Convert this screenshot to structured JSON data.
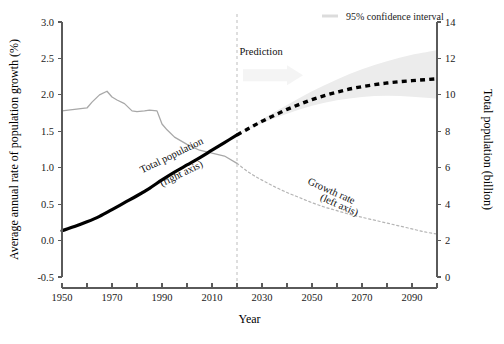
{
  "chart_data": {
    "type": "line",
    "title": "",
    "xlabel": "Year",
    "ylabel_left": "Average annual rate of population growth (%)",
    "ylabel_right": "Total population (billion)",
    "xlim": [
      1950,
      2100
    ],
    "ylim_left": [
      -0.5,
      3.0
    ],
    "ylim_right": [
      0,
      14
    ],
    "x_ticks_labeled": [
      1950,
      1970,
      1990,
      2010,
      2030,
      2050,
      2070,
      2090
    ],
    "x_ticks_minor": [
      1960,
      1980,
      2000,
      2020,
      2040,
      2060,
      2080,
      2100
    ],
    "y_ticks_left": [
      "3.0",
      "2.5",
      "2.0",
      "1.5",
      "1.0",
      "0.5",
      "0.0",
      "-0.5"
    ],
    "y_ticks_right": [
      "14",
      "12",
      "10",
      "8",
      "6",
      "4",
      "2",
      "0"
    ],
    "grid": false,
    "prediction_start_year": 2020,
    "annotations": [
      {
        "name": "prediction-label",
        "text": "Prediction",
        "x": 2021,
        "y_left": 2.55
      },
      {
        "name": "total-population-label-line1",
        "text": "Total population",
        "x": 1982,
        "y_left": 0.92
      },
      {
        "name": "total-population-label-line2",
        "text": "(right axis)",
        "x": 1990,
        "y_left": 0.74
      },
      {
        "name": "growth-rate-label-line1",
        "text": "Growth rate",
        "x": 2048,
        "y_left": 0.78
      },
      {
        "name": "growth-rate-label-line2",
        "text": "(left axis)",
        "x": 2053,
        "y_left": 0.56
      }
    ],
    "legend": {
      "position": "top-right",
      "entries": [
        {
          "label": "95% confidence interval",
          "color": "#dcdcdc",
          "marker": "line"
        }
      ]
    },
    "series": [
      {
        "name": "Growth rate (historical)",
        "axis": "left",
        "style": "solid",
        "color": "#a8a8a8",
        "x": [
          1950,
          1955,
          1960,
          1962,
          1965,
          1968,
          1970,
          1972,
          1975,
          1978,
          1980,
          1983,
          1985,
          1988,
          1990,
          1992,
          1995,
          2000,
          2005,
          2010,
          2015,
          2020
        ],
        "y": [
          1.78,
          1.8,
          1.82,
          1.9,
          2.0,
          2.05,
          1.97,
          1.93,
          1.88,
          1.78,
          1.77,
          1.78,
          1.79,
          1.78,
          1.6,
          1.52,
          1.42,
          1.32,
          1.24,
          1.2,
          1.16,
          1.06
        ]
      },
      {
        "name": "Growth rate (projection)",
        "axis": "left",
        "style": "dotted",
        "color": "#b5b5b5",
        "x": [
          2020,
          2025,
          2030,
          2035,
          2040,
          2045,
          2050,
          2055,
          2060,
          2065,
          2070,
          2075,
          2080,
          2085,
          2090,
          2095,
          2100
        ],
        "y": [
          1.06,
          0.93,
          0.83,
          0.74,
          0.66,
          0.59,
          0.52,
          0.46,
          0.41,
          0.36,
          0.32,
          0.28,
          0.24,
          0.2,
          0.16,
          0.12,
          0.09
        ]
      },
      {
        "name": "Total population (historical)",
        "axis": "right",
        "style": "solid-bold",
        "color": "#000000",
        "x": [
          1950,
          1955,
          1960,
          1965,
          1970,
          1975,
          1980,
          1985,
          1990,
          1995,
          2000,
          2005,
          2010,
          2015,
          2020
        ],
        "y": [
          2.54,
          2.77,
          3.03,
          3.33,
          3.7,
          4.08,
          4.46,
          4.87,
          5.33,
          5.76,
          6.15,
          6.54,
          6.96,
          7.38,
          7.8
        ]
      },
      {
        "name": "Total population (projection)",
        "axis": "right",
        "style": "dashed-bold",
        "color": "#000000",
        "x": [
          2020,
          2025,
          2030,
          2035,
          2040,
          2045,
          2050,
          2055,
          2060,
          2065,
          2070,
          2075,
          2080,
          2085,
          2090,
          2095,
          2100
        ],
        "y": [
          7.8,
          8.18,
          8.55,
          8.88,
          9.2,
          9.48,
          9.74,
          9.96,
          10.15,
          10.32,
          10.45,
          10.56,
          10.65,
          10.72,
          10.78,
          10.83,
          10.88
        ]
      },
      {
        "name": "95% confidence interval upper",
        "axis": "right",
        "style": "band",
        "color": "#ececec",
        "x": [
          2020,
          2030,
          2040,
          2050,
          2060,
          2070,
          2080,
          2090,
          2100
        ],
        "y": [
          7.82,
          8.66,
          9.45,
          10.2,
          10.85,
          11.4,
          11.85,
          12.2,
          12.45
        ]
      },
      {
        "name": "95% confidence interval lower",
        "axis": "right",
        "style": "band",
        "color": "#ececec",
        "x": [
          2020,
          2030,
          2040,
          2050,
          2060,
          2070,
          2080,
          2090,
          2100
        ],
        "y": [
          7.78,
          8.44,
          8.96,
          9.4,
          9.7,
          9.88,
          9.95,
          9.9,
          9.8
        ]
      }
    ]
  }
}
